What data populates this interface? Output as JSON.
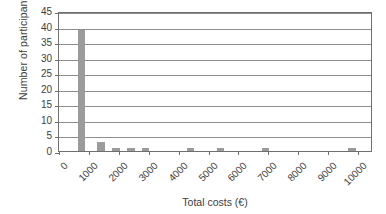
{
  "chart_data": {
    "type": "bar",
    "title": "",
    "subtitle": "",
    "xlabel": "Total costs (€)",
    "ylabel": "Number of participants",
    "xlim": [
      0,
      10500
    ],
    "ylim": [
      0,
      45
    ],
    "ytick_step": 5,
    "yticks": [
      0,
      5,
      10,
      15,
      20,
      25,
      30,
      35,
      40,
      45
    ],
    "ytick_labels": [
      "0",
      "5",
      "10",
      "15",
      "20",
      "25",
      "30",
      "35",
      "40",
      "45"
    ],
    "xticks": [
      0,
      1000,
      2000,
      3000,
      4000,
      5000,
      6000,
      7000,
      8000,
      9000,
      10000
    ],
    "xtick_labels": [
      "0",
      "1000",
      "2000",
      "3000",
      "4000",
      "5000",
      "6000",
      "7000",
      "8000",
      "9000",
      "10000"
    ],
    "xtick_rotation_deg": -45,
    "grid": "horizontal",
    "legend": "none",
    "bar_color": "#9b9b9b",
    "axis_color": "#6f6f6f",
    "gridline_color": "#8d8d8d",
    "bin_width": 250,
    "bars": [
      {
        "x": 750,
        "value": 39,
        "label": "750"
      },
      {
        "x": 1400,
        "value": 3,
        "label": "1400"
      },
      {
        "x": 1900,
        "value": 1,
        "label": "1900"
      },
      {
        "x": 2400,
        "value": 1,
        "label": "2400"
      },
      {
        "x": 2900,
        "value": 1,
        "label": "2900"
      },
      {
        "x": 4400,
        "value": 1,
        "label": "4400"
      },
      {
        "x": 5400,
        "value": 1,
        "label": "5400"
      },
      {
        "x": 6900,
        "value": 1,
        "label": "6900"
      },
      {
        "x": 9800,
        "value": 1,
        "label": "9800"
      }
    ],
    "categories": [
      "750",
      "1400",
      "1900",
      "2400",
      "2900",
      "4400",
      "5400",
      "6900",
      "9800"
    ],
    "values": [
      39,
      3,
      1,
      1,
      1,
      1,
      1,
      1,
      1
    ]
  }
}
